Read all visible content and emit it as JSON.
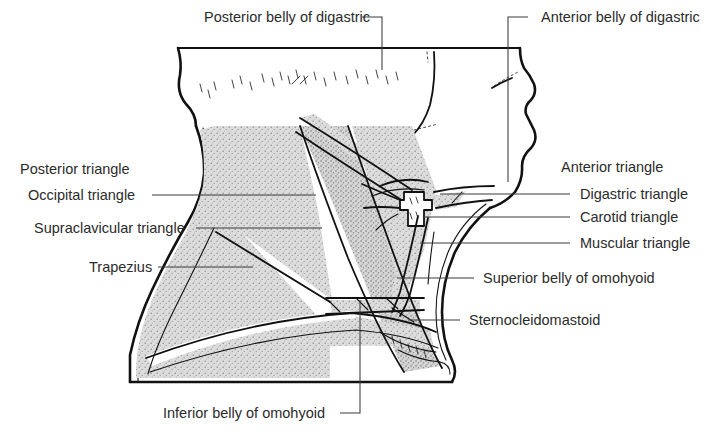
{
  "figure": {
    "background_color": "#ffffff",
    "ink_color": "#111111",
    "shade_color": "#d8d8d8",
    "label_color": "#2b2b2b",
    "width": 709,
    "height": 436
  },
  "labels": {
    "top": [
      {
        "id": "posterior-belly-of-digastric",
        "text": "Posterior belly of digastric",
        "x": 204,
        "y": 22,
        "anchor": "start"
      },
      {
        "id": "anterior-belly-of-digastric",
        "text": "Anterior belly of digastric",
        "x": 541,
        "y": 22,
        "anchor": "start"
      }
    ],
    "left": [
      {
        "id": "posterior-triangle",
        "text": "Posterior triangle",
        "x": 20,
        "y": 174,
        "anchor": "start"
      },
      {
        "id": "occipital-triangle",
        "text": "Occipital triangle",
        "x": 28,
        "y": 200,
        "anchor": "start"
      },
      {
        "id": "supraclavicular-triangle",
        "text": "Supraclavicular triangle",
        "x": 34,
        "y": 233,
        "anchor": "start"
      },
      {
        "id": "trapezius",
        "text": "Trapezius",
        "x": 89,
        "y": 272,
        "anchor": "start"
      }
    ],
    "right": [
      {
        "id": "anterior-triangle",
        "text": "Anterior triangle",
        "x": 561,
        "y": 172,
        "anchor": "start"
      },
      {
        "id": "digastric-triangle",
        "text": "Digastric triangle",
        "x": 580,
        "y": 199,
        "anchor": "start"
      },
      {
        "id": "carotid-triangle",
        "text": "Carotid triangle",
        "x": 580,
        "y": 222,
        "anchor": "start"
      },
      {
        "id": "muscular-triangle",
        "text": "Muscular triangle",
        "x": 580,
        "y": 248,
        "anchor": "start"
      },
      {
        "id": "superior-belly-of-omohyoid",
        "text": "Superior belly of omohyoid",
        "x": 483,
        "y": 283,
        "anchor": "start"
      },
      {
        "id": "sternocleidomastoid",
        "text": "Sternocleidomastoid",
        "x": 469,
        "y": 325,
        "anchor": "start"
      }
    ],
    "bottom": [
      {
        "id": "inferior-belly-of-omohyoid",
        "text": "Inferior belly of omohyoid",
        "x": 163,
        "y": 418,
        "anchor": "start"
      }
    ]
  },
  "leaders": {
    "posterior_belly_of_digastric": "M 362 17 L 382 17 L 382 70",
    "anterior_belly_of_digastric": "M 528 17 L 508 17 L 508 182",
    "occipital_triangle": "M 152 195 L 316 195",
    "supraclavicular_triangle": "M 196 228 L 322 228",
    "trapezius": "M 158 267 L 253 267",
    "digastric_triangle": "M 570 194 L 440 194",
    "carotid_triangle": "M 570 217 L 424 217",
    "muscular_triangle": "M 570 243 L 420 243",
    "superior_belly_of_omohyoid": "M 474 278 L 397 278",
    "sternocleidomastoid": "M 460 320 L 408 320",
    "inferior_belly_of_omohyoid": "M 340 413 L 360 413 L 360 300"
  },
  "anatomy": {
    "structures": [
      "skull-base-outline",
      "mandible-and-chin-profile",
      "lips-profile",
      "sternocleidomastoid-muscle",
      "trapezius-muscle",
      "posterior-belly-of-digastric",
      "anterior-belly-of-digastric",
      "hyoid-bone",
      "superior-belly-of-omohyoid",
      "inferior-belly-of-omohyoid",
      "clavicle"
    ]
  }
}
